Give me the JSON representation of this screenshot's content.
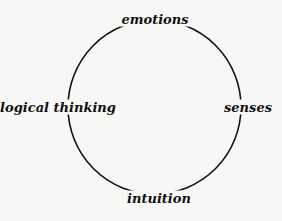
{
  "diagram": {
    "type": "cycle",
    "shape": "circle",
    "stroke_color": "#111111",
    "background_color": "#f7f7f5",
    "nodes": [
      {
        "id": "top",
        "label": "emotions"
      },
      {
        "id": "left",
        "label": "logical thinking"
      },
      {
        "id": "right",
        "label": "senses"
      },
      {
        "id": "bottom",
        "label": "intuition"
      }
    ]
  }
}
